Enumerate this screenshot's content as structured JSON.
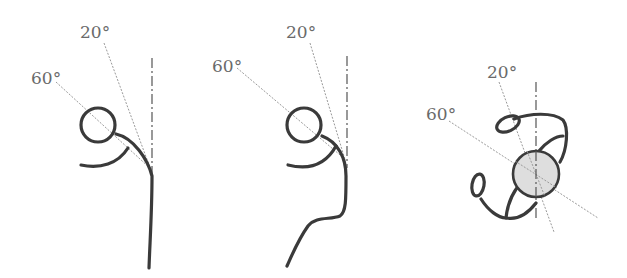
{
  "figures": [
    {
      "name": "side-view-upright",
      "angle_labels": {
        "upper": "20°",
        "lower": "60°"
      }
    },
    {
      "name": "side-view-leaning",
      "angle_labels": {
        "upper": "20°",
        "lower": "60°"
      }
    },
    {
      "name": "top-view",
      "angle_labels": {
        "upper": "20°",
        "lower": "60°"
      }
    }
  ],
  "colors": {
    "stroke": "#3a3a3a",
    "guide": "#9a9a9a",
    "label": "#6a6a6a",
    "head_fill": "#dedede"
  }
}
